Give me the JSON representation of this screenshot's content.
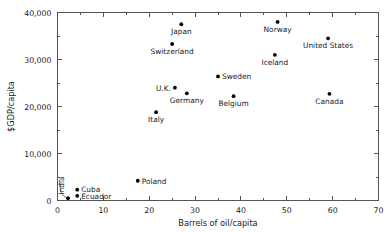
{
  "chart_data": {
    "type": "scatter",
    "title": "",
    "xlabel": "Barrels of oil/capita",
    "ylabel": "$GDP/capita",
    "xlim": [
      0,
      70
    ],
    "ylim": [
      0,
      40000
    ],
    "grid": false,
    "legend": null,
    "xticks": [
      0,
      10,
      20,
      30,
      40,
      50,
      60,
      70
    ],
    "xticklabels": [
      "0",
      "10",
      "20",
      "30",
      "40",
      "50",
      "60",
      "70"
    ],
    "xminorticks": [
      5,
      15,
      25,
      35,
      45,
      55,
      65
    ],
    "yticks": [
      0,
      10000,
      20000,
      30000,
      40000
    ],
    "yticklabels": [
      "0",
      "10,000",
      "20,000",
      "30,000",
      "40,000"
    ],
    "yminorticks": [
      5000,
      15000,
      25000,
      35000
    ],
    "points": [
      {
        "label": "India",
        "x": 2.3,
        "y": 500,
        "label_pos": "rotated-left"
      },
      {
        "label": "Cuba",
        "x": 4.3,
        "y": 2300,
        "label_pos": "right"
      },
      {
        "label": "Ecuador",
        "x": 4.3,
        "y": 1000,
        "label_pos": "right"
      },
      {
        "label": "Poland",
        "x": 17.5,
        "y": 4200,
        "label_pos": "right"
      },
      {
        "label": "Italy",
        "x": 21.5,
        "y": 18800,
        "label_pos": "below"
      },
      {
        "label": "Switzerland",
        "x": 25.0,
        "y": 33300,
        "label_pos": "below"
      },
      {
        "label": "U.K.",
        "x": 25.6,
        "y": 24000,
        "label_pos": "left"
      },
      {
        "label": "Japan",
        "x": 27.0,
        "y": 37500,
        "label_pos": "below"
      },
      {
        "label": "Germany",
        "x": 28.2,
        "y": 22800,
        "label_pos": "below"
      },
      {
        "label": "Sweden",
        "x": 35.0,
        "y": 26400,
        "label_pos": "right"
      },
      {
        "label": "Belgium",
        "x": 38.4,
        "y": 22200,
        "label_pos": "below"
      },
      {
        "label": "Iceland",
        "x": 47.4,
        "y": 31000,
        "label_pos": "below"
      },
      {
        "label": "Norway",
        "x": 48.0,
        "y": 38000,
        "label_pos": "below"
      },
      {
        "label": "Canada",
        "x": 59.3,
        "y": 22700,
        "label_pos": "below"
      },
      {
        "label": "United States",
        "x": 59.0,
        "y": 34500,
        "label_pos": "below"
      }
    ],
    "colors": {
      "marker": "#000000",
      "axis": "#555555",
      "text": "#1a1a1a",
      "background": "#ffffff"
    }
  }
}
